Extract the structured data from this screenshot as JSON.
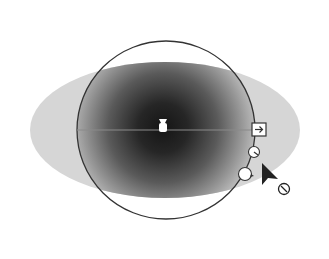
{
  "canvas": {
    "width": 329,
    "height": 259,
    "background": "#ffffff"
  },
  "gradient_shape": {
    "type": "ellipse",
    "cx": 165,
    "cy": 130,
    "rx": 135,
    "ry": 68,
    "outer_color": "#d6d6d6",
    "center_color": "#1a1a1a"
  },
  "gradient_annotator": {
    "circle": {
      "cx": 166,
      "cy": 130,
      "r": 89,
      "stroke": "#333333"
    },
    "axis_line": {
      "x1": 77,
      "y1": 130,
      "x2": 256,
      "y2": 130,
      "stroke": "#8a8a8a"
    },
    "origin_stop": {
      "x": 163,
      "y": 126
    },
    "end_handle": {
      "x": 259,
      "y": 130,
      "icon": "arrow-right-square-icon"
    },
    "rotate_handle": {
      "x": 254,
      "y": 152
    },
    "aspect_handle": {
      "x": 245,
      "y": 173
    }
  },
  "cursor": {
    "icon": "arrow-pointer-icon",
    "x": 262,
    "y": 163,
    "badge_icon": "slash-circle-icon",
    "badge_x": 284,
    "badge_y": 189
  },
  "labels": {
    "description": "Radial gradient annotator with resize cursor"
  }
}
